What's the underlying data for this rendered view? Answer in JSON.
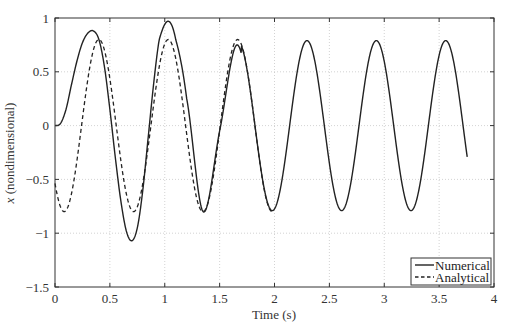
{
  "chart_data": {
    "type": "line",
    "title": "",
    "xlabel": "Time (s)",
    "ylabel_italic": "x",
    "ylabel_rest": " (nondimensional)",
    "ylabel": "x (nondimensional)",
    "xlim": [
      0,
      4
    ],
    "ylim": [
      -1.5,
      1
    ],
    "xticks": [
      0,
      0.5,
      1,
      1.5,
      2,
      2.5,
      3,
      3.5,
      4
    ],
    "xtick_labels": [
      "0",
      "0.5",
      "1",
      "1.5",
      "2",
      "2.5",
      "3",
      "3.5",
      "4"
    ],
    "yticks": [
      -1.5,
      -1,
      -0.5,
      0,
      0.5,
      1
    ],
    "ytick_labels": [
      "−1.5",
      "−1",
      "−0.5",
      "0",
      "0.5",
      "1"
    ],
    "grid": true,
    "legend_position": "lower right",
    "series": [
      {
        "name": "Numerical",
        "style": "solid",
        "color": "#222222",
        "x": [
          0,
          0.05,
          0.1,
          0.15,
          0.2,
          0.25,
          0.3,
          0.35,
          0.4,
          0.45,
          0.5,
          0.55,
          0.6,
          0.65,
          0.7,
          0.75,
          0.8,
          0.85,
          0.9,
          0.95,
          1.03,
          1.1,
          1.2,
          1.35,
          1.5,
          1.66,
          1.82,
          1.98,
          2.13,
          2.29,
          2.45,
          2.61,
          2.77,
          2.92,
          3.08,
          3.24,
          3.4,
          3.56,
          3.66,
          3.76
        ],
        "values": [
          0,
          0.02,
          0.15,
          0.38,
          0.6,
          0.77,
          0.86,
          0.88,
          0.8,
          0.55,
          0.15,
          -0.3,
          -0.7,
          -0.98,
          -1.07,
          -0.95,
          -0.6,
          -0.1,
          0.4,
          0.8,
          0.97,
          0.8,
          0.25,
          -0.8,
          -0.05,
          0.75,
          -0.05,
          -0.77,
          0.0,
          0.8,
          0.0,
          -0.8,
          0.0,
          0.8,
          0.0,
          -0.78,
          0.0,
          0.8,
          0.45,
          -0.44
        ]
      },
      {
        "name": "Analytical",
        "style": "dashed",
        "color": "#222222",
        "amplitude": 0.8,
        "period_s": 0.632,
        "phase_peak_s": 0.4,
        "x": [
          0,
          0.08,
          0.24,
          0.4,
          0.56,
          0.72,
          0.87,
          1.03,
          1.19,
          1.35,
          1.51,
          1.67,
          1.82,
          1.98
        ],
        "values": [
          -0.54,
          -0.8,
          0.0,
          0.8,
          0.0,
          -0.78,
          0.0,
          0.8,
          0.0,
          -0.78,
          0.0,
          0.8,
          0.0,
          -0.75
        ]
      }
    ]
  },
  "legend": {
    "items": [
      "Numerical",
      "Analytical"
    ]
  }
}
